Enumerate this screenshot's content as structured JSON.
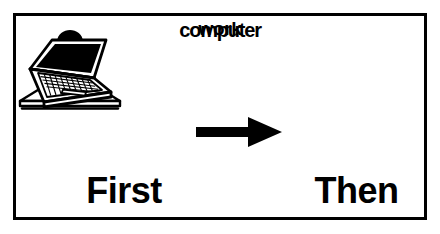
{
  "card": {
    "type": "first-then-visual-schedule",
    "background_color": "#ffffff",
    "line_color": "#000000",
    "border_width_px": 3
  },
  "first": {
    "caption": "First",
    "picture_label": "work",
    "icon_name": "person-working-at-desk-icon",
    "icon_description": "Line drawing of a person with dark hair and dark shirt sitting with folded hands at a desk"
  },
  "then": {
    "caption": "Then",
    "picture_label": "computer",
    "icon_name": "laptop-computer-icon",
    "icon_description": "Line drawing of an open laptop computer in perspective with a black screen and a keyboard"
  },
  "connector": {
    "icon_name": "arrow-right-icon",
    "label": "arrow pointing right",
    "color": "#000000"
  }
}
